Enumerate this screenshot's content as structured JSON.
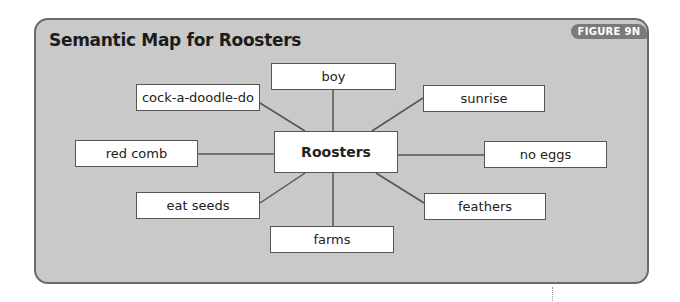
{
  "figure": {
    "title": "Semantic Map for Roosters",
    "badge": "FIGURE 9N",
    "colors": {
      "panel_bg": "#c9c9c9",
      "panel_border": "#6a6a6a",
      "badge_bg": "#7a7a7a",
      "node_bg": "#ffffff",
      "line": "#555555"
    }
  },
  "map": {
    "center": {
      "label": "Roosters"
    },
    "nodes": [
      {
        "id": "boy",
        "label": "boy"
      },
      {
        "id": "cock",
        "label": "cock-a-doodle-do"
      },
      {
        "id": "sunrise",
        "label": "sunrise"
      },
      {
        "id": "redcomb",
        "label": "red comb"
      },
      {
        "id": "noeggs",
        "label": "no eggs"
      },
      {
        "id": "eatseeds",
        "label": "eat seeds"
      },
      {
        "id": "feathers",
        "label": "feathers"
      },
      {
        "id": "farms",
        "label": "farms"
      }
    ]
  }
}
